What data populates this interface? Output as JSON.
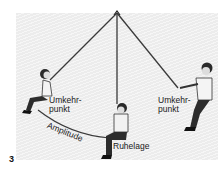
{
  "figure": {
    "number": "3",
    "labels": {
      "left_turning_point": [
        "Umkehr-",
        "punkt"
      ],
      "right_turning_point": [
        "Umkehr-",
        "punkt"
      ],
      "amplitude": "Amplitude",
      "rest_position": "Ruhelage"
    },
    "colors": {
      "panel": "#ececec",
      "rope": "#3a3a3a",
      "text": "#1a1a1a"
    }
  }
}
